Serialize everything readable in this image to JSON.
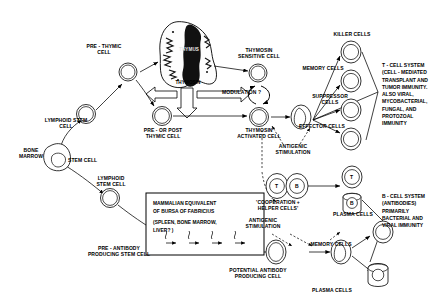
{
  "diagram": {
    "ink": "#000000",
    "background": "#ffffff"
  },
  "labels": {
    "pre_thymic_cell": "PRE - THYMIC\nCELL",
    "lymphoid_stem_cell_top": "LYMPHOID STEM\nCELL",
    "pre_or_post_thymic_cell": "PRE - OR POST\nTHYMIC CELL",
    "thymus": "THYMUS",
    "thymosin": "THYMOSIN",
    "thymosin_sensitive_cell": "THYMOSIN\nSENSITIVE CELL",
    "modulation": "MODULATION ?",
    "thymosin_activated_cell": "THYMOSIN\nACTIVATED CELL",
    "antigenic_stimulation_top": "ANTIGENIC\nSTIMULATION",
    "killer_cells": "KILLER CELLS",
    "memory_cells_top": "MEMORY CELLS",
    "suppressor_cells": "SUPPRESSOR\nCELLS",
    "effector_cells": "EFFECTOR CELLS",
    "bone_marrow": "BONE\nMARROW",
    "stem_cell": "STEM CELL",
    "lymphoid_stem_cell_bottom": "LYMPHOID\nSTEM CELL",
    "pre_antibody_producing_stem_cell": "PRE - ANTIBODY\nPRODUCING STEM CELL",
    "potential_antibody_producing_cell": "POTENTIAL ANTIBODY\nPRODUCING CELL",
    "antigenic_stimulation_mid": "ANTIGENIC\nSTIMULATION",
    "cooperation_helper_cells": "'COOPERATION +\nHELPER CELLS'",
    "plasma_cells_upper": "PLASMA CELLS",
    "memory_cells_bottom": "MEMORY CELLS",
    "plasma_cells_lower": "PLASMA CELLS",
    "t_mark": "T",
    "b_mark": "B",
    "t_mark_plasma": "T",
    "b_mark_plasma": "B"
  },
  "bursa_box": {
    "line1": "MAMMALIAN EQUIVALENT",
    "line2": "OF BURSA OF FABRICIUS",
    "line3": "(SPLEEN, BONE MARROW,",
    "line4": "LIVER? )"
  },
  "legends": {
    "t_cell_system": "T - CELL SYSTEM\n(CELL - MEDIATED\nTRANSPLANT AND\nTUMOR IMMUNITY.\nALSO VIRAL,\nMYCOBACTERIAL,\nFUNGAL, AND\nPROTOZOAL\nIMMUNITY",
    "b_cell_system": "B - CELL SYSTEM\n(ANTIBODIES)\nPRIMARILY\nBACTERIAL AND\nVIRAL IMMUNITY"
  }
}
